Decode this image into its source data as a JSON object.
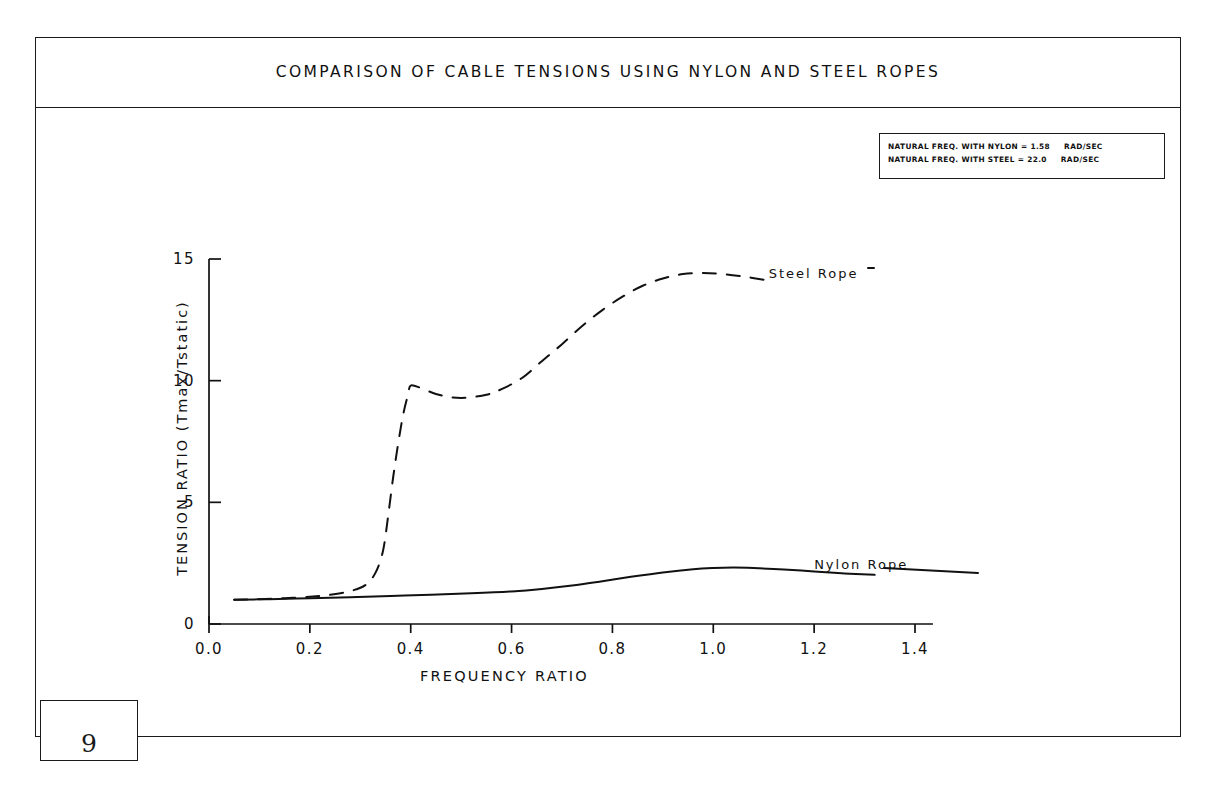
{
  "page": {
    "number": "9"
  },
  "header": {
    "title": "COMPARISON OF CABLE TENSIONS USING NYLON AND STEEL ROPES"
  },
  "annotation_box": {
    "lines": [
      {
        "text": "NATURAL FREQ. WITH NYLON = 1.58",
        "units": "RAD/SEC",
        "label": "NATURAL FREQ. WITH NYLON",
        "value": "1.58"
      },
      {
        "text": "NATURAL FREQ. WITH STEEL = 22.0",
        "units": "RAD/SEC",
        "label": "NATURAL FREQ. WITH STEEL",
        "value": "22.0"
      }
    ]
  },
  "chart_data": {
    "type": "line",
    "title": "COMPARISON OF CABLE TENSIONS USING NYLON AND STEEL ROPES",
    "xlabel": "FREQUENCY RATIO",
    "ylabel": "TENSION RATIO (Tmax/Tstatic)",
    "xlim": [
      0.0,
      1.4
    ],
    "ylim": [
      0,
      15
    ],
    "xticks": [
      "0.0",
      "0.2",
      "0.4",
      "0.6",
      "0.8",
      "1.0",
      "1.2",
      "1.4"
    ],
    "xtick_values": [
      0.0,
      0.2,
      0.4,
      0.6,
      0.8,
      1.0,
      1.2,
      1.4
    ],
    "yticks": [
      "0",
      "5",
      "10",
      "15"
    ],
    "ytick_values": [
      0,
      5,
      10,
      15
    ],
    "grid": false,
    "legend": "inline-labels",
    "series": [
      {
        "name": "Steel Rope",
        "style": "dashed",
        "label_x": 1.11,
        "label_y": 14.35,
        "x": [
          0.05,
          0.1,
          0.15,
          0.2,
          0.24,
          0.28,
          0.31,
          0.33,
          0.345,
          0.355,
          0.365,
          0.375,
          0.385,
          0.395,
          0.4,
          0.42,
          0.45,
          0.48,
          0.51,
          0.55,
          0.58,
          0.62,
          0.66,
          0.7,
          0.74,
          0.78,
          0.82,
          0.86,
          0.9,
          0.94,
          0.98,
          1.02,
          1.06,
          1.1
        ],
        "y": [
          1.0,
          1.02,
          1.06,
          1.12,
          1.2,
          1.35,
          1.6,
          2.1,
          3.0,
          4.4,
          6.0,
          7.4,
          8.6,
          9.45,
          9.8,
          9.7,
          9.45,
          9.32,
          9.3,
          9.42,
          9.65,
          10.1,
          10.8,
          11.5,
          12.25,
          12.9,
          13.45,
          13.9,
          14.2,
          14.38,
          14.42,
          14.38,
          14.28,
          14.15
        ]
      },
      {
        "name": "Nylon Rope",
        "style": "solid",
        "label_x": 1.2,
        "label_y": 2.38,
        "x": [
          0.05,
          0.12,
          0.2,
          0.28,
          0.36,
          0.44,
          0.52,
          0.6,
          0.66,
          0.72,
          0.78,
          0.84,
          0.9,
          0.96,
          1.0,
          1.04,
          1.08,
          1.14,
          1.2,
          1.26,
          1.32
        ],
        "y": [
          1.0,
          1.02,
          1.06,
          1.1,
          1.15,
          1.2,
          1.26,
          1.34,
          1.44,
          1.58,
          1.76,
          1.95,
          2.12,
          2.25,
          2.3,
          2.32,
          2.3,
          2.24,
          2.16,
          2.08,
          2.02
        ]
      }
    ]
  }
}
